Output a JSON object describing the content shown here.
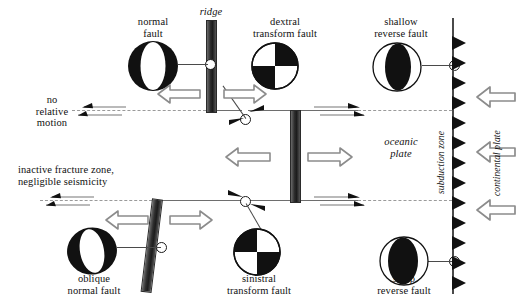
{
  "figure": {
    "type": "tectonic-schematic"
  },
  "labels": {
    "normal_fault": "normal\nfault",
    "ridge": "ridge",
    "dextral_transform_fault": "dextral\ntransform fault",
    "shallow_reverse_fault": "shallow\nreverse fault",
    "no_relative_motion": "no\nrelative\nmotion",
    "inactive_fracture_zone": "inactive fracture zone,\nnegligible seismicity",
    "oceanic_plate": "oceanic\nplate",
    "subduction_zone": "subduction zone",
    "continental_plate": "continental plate",
    "oblique_normal_fault": "oblique\nnormal fault",
    "sinistral_transform_fault": "sinistral\ntransform fault",
    "steep_reverse_fault": "steep\nreverse fault"
  },
  "colors": {
    "ink": "#111111",
    "ridge_dark": "#1c1c1c",
    "ridge_light": "#6a6a6a",
    "line_gray": "#6e6e6e",
    "dash_gray": "#9a9a9a",
    "arrow_outline": "#8c8c8c",
    "paper": "#ffffff"
  },
  "beachballs": [
    {
      "name": "normal-fault-beachball",
      "mechanism": "normal",
      "style": "black-disc-white-lens",
      "tilt": 0
    },
    {
      "name": "dextral-transform-beachball",
      "mechanism": "strike-slip-dextral",
      "style": "quadrants-dextral",
      "tilt": 0
    },
    {
      "name": "shallow-reverse-beachball",
      "mechanism": "reverse-shallow",
      "style": "white-disc-black-lens",
      "tilt": 0
    },
    {
      "name": "oblique-normal-beachball",
      "mechanism": "oblique-normal",
      "style": "black-disc-white-lens",
      "tilt": -12
    },
    {
      "name": "sinistral-transform-beachball",
      "mechanism": "strike-slip-sinistral",
      "style": "quadrants-sinistral",
      "tilt": 0
    },
    {
      "name": "steep-reverse-beachball",
      "mechanism": "reverse-steep",
      "style": "white-disc-black-lens-wide",
      "tilt": 0
    }
  ],
  "elements": {
    "ridge_segments": 3,
    "transform_segments": 4,
    "subduction_barbs": 14,
    "spreading_arrow_pairs": 3,
    "convergence_arrows": 3,
    "shear_arrow_pairs": 3
  }
}
